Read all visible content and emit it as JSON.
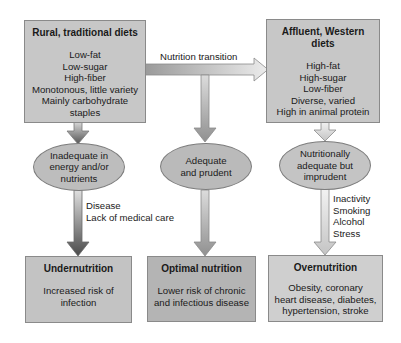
{
  "diagram": {
    "colors": {
      "box_top": "#c7c7c7",
      "box_bottom_left": "#c3c3c3",
      "box_bottom_mid": "#b4b4b4",
      "box_bottom_right": "#cfcfcf",
      "ellipse": "#bdbdbd",
      "arrow_dark": "#5a5a5a",
      "arrow_light": "#e6e6e6"
    },
    "top_left": {
      "title": "Rural, traditional diets",
      "lines": [
        "Low-fat",
        "Low-sugar",
        "High-fiber",
        "Monotonous, little variety",
        "Mainly carbohydrate",
        "staples"
      ]
    },
    "top_right": {
      "title_line1": "Affluent, Western",
      "title_line2": "diets",
      "lines": [
        "High-fat",
        "High-sugar",
        "Low-fiber",
        "Diverse, varied",
        "High in animal protein"
      ]
    },
    "transition_label": "Nutrition transition",
    "ellipses": {
      "left": [
        "Inadequate in",
        "energy and/or",
        "nutrients"
      ],
      "middle": [
        "Adequate",
        "and prudent"
      ],
      "right": [
        "Nutritionally",
        "adequate but",
        "imprudent"
      ]
    },
    "factors": {
      "left": [
        "Disease",
        "Lack of medical care"
      ],
      "right": [
        "Inactivity",
        "Smoking",
        "Alcohol",
        "Stress"
      ]
    },
    "bottom": {
      "left": {
        "title": "Undernutrition",
        "lines": [
          "Increased risk of",
          "infection"
        ]
      },
      "middle": {
        "title": "Optimal nutrition",
        "lines": [
          "Lower risk of chronic",
          "and infectious disease"
        ]
      },
      "right": {
        "title": "Overnutrition",
        "lines": [
          "Obesity, coronary",
          "heart disease, diabetes,",
          "hypertension, stroke"
        ]
      }
    }
  }
}
